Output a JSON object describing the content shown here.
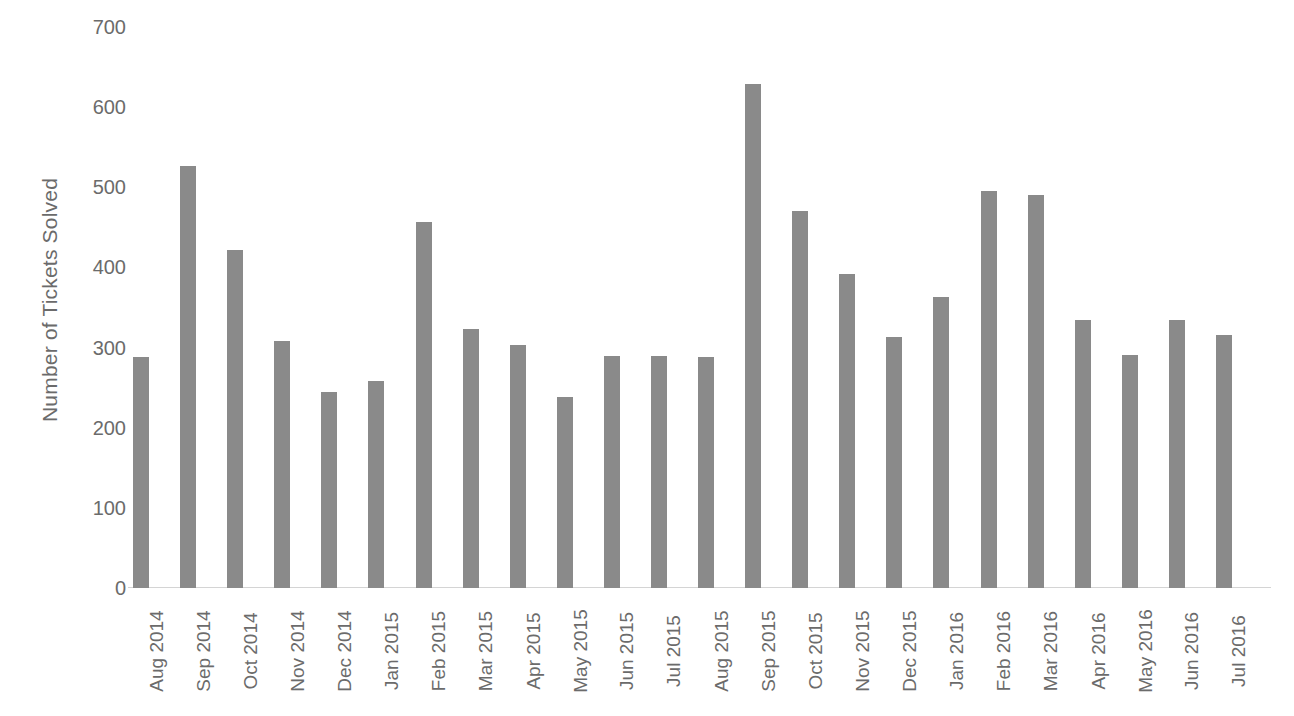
{
  "chart_data": {
    "type": "bar",
    "title": "",
    "xlabel": "",
    "ylabel": "Number of Tickets Solved",
    "ylim": [
      0,
      700
    ],
    "ytick_step": 100,
    "yticks": [
      "700",
      "600",
      "500",
      "400",
      "300",
      "200",
      "100",
      "0"
    ],
    "ytick_values": [
      700,
      600,
      500,
      400,
      300,
      200,
      100,
      0
    ],
    "grid": false,
    "legend": false,
    "bar_color": "#8a8a8a",
    "axis_color": "#d4d4d4",
    "text_color": "#6b6b6b",
    "background": "#ffffff",
    "categories": [
      "Aug 2014",
      "Sep 2014",
      "Oct 2014",
      "Nov 2014",
      "Dec 2014",
      "Jan 2015",
      "Feb 2015",
      "Mar 2015",
      "Apr 2015",
      "May 2015",
      "Jun 2015",
      "Jul 2015",
      "Aug 2015",
      "Sep 2015",
      "Oct 2015",
      "Nov 2015",
      "Dec 2015",
      "Jan 2016",
      "Feb 2016",
      "Mar 2016",
      "Apr 2016",
      "May 2016",
      "Jun 2016",
      "Jul 2016"
    ],
    "values": [
      288,
      526,
      422,
      308,
      245,
      258,
      457,
      323,
      303,
      238,
      290,
      290,
      288,
      629,
      471,
      392,
      313,
      363,
      496,
      490,
      334,
      291,
      335,
      316
    ]
  }
}
